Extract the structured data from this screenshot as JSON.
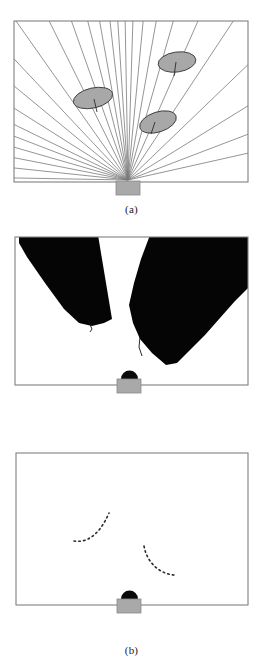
{
  "figure": {
    "width": 263,
    "height": 667,
    "background_color": "#ffffff"
  },
  "colors": {
    "frame_stroke": "#808080",
    "ray_stroke": "#7a7a7a",
    "obstacle_fill": "#a8a8a8",
    "obstacle_stroke": "#3c3c3c",
    "obstacle_stem": "#2b2b2b",
    "shadow_fill": "#050505",
    "robot_body_fill": "#a9a9a9",
    "robot_body_stroke": "#8a8a8a",
    "robot_dome_fill": "#0a0a0a",
    "contour_dot": "#2a2a2a",
    "caption_text": "#1a1a1a"
  },
  "panels": [
    {
      "id": "a",
      "caption": "(a)",
      "description": "Sensor beams radiating from the robot across the room and striking three elliptical obstacles",
      "frame": {
        "x": 14,
        "y": 21,
        "width": 234,
        "height": 161
      },
      "robot": {
        "x": 128,
        "y": 182,
        "body_width": 24,
        "body_height": 14,
        "dome": false,
        "label": "robot"
      },
      "ray_origin": {
        "x": 128,
        "y": 180
      },
      "ray_count": 26,
      "rays_deg": [
        181,
        186,
        191,
        196,
        201,
        206,
        212,
        219,
        226,
        234,
        243,
        250,
        256,
        261,
        265,
        268,
        271,
        274,
        278,
        283,
        289,
        297,
        307,
        320,
        336,
        354
      ],
      "obstacles": [
        {
          "name": "obstacle-upper-right",
          "cx": 177,
          "cy": 62,
          "rx": 19,
          "ry": 10,
          "rotation_deg": -8,
          "stem_dx": -2,
          "stem_dy": 12
        },
        {
          "name": "obstacle-left",
          "cx": 93,
          "cy": 98,
          "rx": 20,
          "ry": 10,
          "rotation_deg": -13,
          "stem_dx": 1,
          "stem_dy": 12
        },
        {
          "name": "obstacle-center",
          "cx": 158,
          "cy": 122,
          "rx": 19,
          "ry": 10,
          "rotation_deg": -18,
          "stem_dx": -5,
          "stem_dy": 11
        }
      ]
    },
    {
      "id": "b",
      "caption": "(b)",
      "description": "Black occlusion shadow cones cast behind the obstacles as seen from the robot",
      "frame": {
        "x": 15,
        "y": 12,
        "width": 233,
        "height": 148
      },
      "robot": {
        "x": 129,
        "y": 160,
        "body_width": 24,
        "body_height": 14,
        "dome": true,
        "label": "robot"
      },
      "shadows": [
        {
          "name": "shadow-left",
          "points": "20,12 95,12 110,92 80,99 56,84 20,30"
        },
        {
          "name": "shadow-right",
          "points": "152,12 248,40 248,12 248,60 162,136 135,112 130,88"
        }
      ],
      "shadow_marks": [
        {
          "name": "contour-mark-left",
          "x1": 88,
          "y1": 95,
          "x2": 93,
          "y2": 105
        },
        {
          "name": "contour-mark-right",
          "x1": 139,
          "y1": 117,
          "x2": 145,
          "y2": 131
        }
      ]
    },
    {
      "id": "c",
      "caption": "(c)",
      "description": "Dotted arcs showing the extracted visible contours of the two detected obstacles",
      "frame": {
        "x": 16,
        "y": 10,
        "width": 232,
        "height": 152
      },
      "robot": {
        "x": 129,
        "y": 162,
        "body_width": 24,
        "body_height": 14,
        "dome": true,
        "label": "robot"
      },
      "contours": [
        {
          "name": "contour-left",
          "points": [
            [
              73,
              537
            ],
            [
              77,
              537
            ],
            [
              81,
              536
            ],
            [
              85,
              535
            ],
            [
              89,
              533
            ],
            [
              93,
              530
            ],
            [
              97,
              527
            ],
            [
              100,
              523
            ],
            [
              103,
              519
            ],
            [
              105,
              514
            ],
            [
              107,
              510
            ],
            [
              108,
              519
            ]
          ],
          "path": "M 73,97 C 85,98 98,92 108,70"
        },
        {
          "name": "contour-right",
          "points": [
            [
              143,
              105
            ],
            [
              145,
              109
            ],
            [
              147,
              113
            ],
            [
              150,
              117
            ],
            [
              153,
              120
            ],
            [
              157,
              123
            ],
            [
              161,
              125
            ],
            [
              165,
              127
            ],
            [
              169,
              128
            ],
            [
              173,
              129
            ]
          ],
          "path": "M 143,103 C 147,119 160,130 173,131"
        }
      ]
    }
  ]
}
